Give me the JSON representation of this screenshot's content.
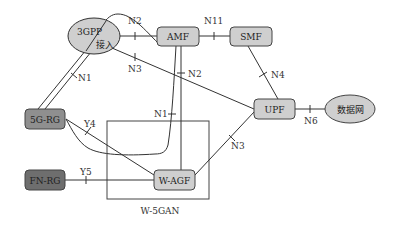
{
  "diagram": {
    "nodes": {
      "access_3gpp": {
        "label_top": "3GPP",
        "label_bottom": "接入",
        "shape": "ellipse",
        "fill": "#cfcfcf"
      },
      "amf": {
        "label": "AMF",
        "shape": "rounded-rect",
        "fill": "#cfcfcf"
      },
      "smf": {
        "label": "SMF",
        "shape": "rounded-rect",
        "fill": "#cfcfcf"
      },
      "upf": {
        "label": "UPF",
        "shape": "rounded-rect",
        "fill": "#cfcfcf"
      },
      "data_network": {
        "label": "数据网",
        "shape": "ellipse",
        "fill": "#cfcfcf"
      },
      "rg_5g": {
        "label": "5G-RG",
        "shape": "rounded-rect",
        "fill": "#8f8f8f"
      },
      "fn_rg": {
        "label": "FN-RG",
        "shape": "rounded-rect",
        "fill": "#6e6e6e"
      },
      "w_agf": {
        "label": "W-AGF",
        "shape": "rounded-rect",
        "fill": "#cfcfcf"
      }
    },
    "group": {
      "label": "W-5GAN"
    },
    "interfaces": {
      "n2_top": "N2",
      "n11": "N11",
      "n3_top": "N3",
      "n1_left": "N1",
      "n2_mid": "N2",
      "n4": "N4",
      "n6": "N6",
      "n1_mid": "N1",
      "y4": "Y4",
      "y5": "Y5",
      "n3_bottom": "N3"
    },
    "edges": [
      {
        "from": "3GPP接入",
        "to": "AMF",
        "interface": "N2"
      },
      {
        "from": "3GPP接入",
        "to": "UPF",
        "interface": "N3"
      },
      {
        "from": "3GPP接入",
        "to": "5G-RG",
        "interface": "N1"
      },
      {
        "from": "AMF",
        "to": "SMF",
        "interface": "N11"
      },
      {
        "from": "AMF",
        "to": "W-AGF",
        "interface": "N2"
      },
      {
        "from": "AMF",
        "to": "5G-RG",
        "interface": "N1"
      },
      {
        "from": "SMF",
        "to": "UPF",
        "interface": "N4"
      },
      {
        "from": "UPF",
        "to": "数据网",
        "interface": "N6"
      },
      {
        "from": "5G-RG",
        "to": "W-AGF",
        "interface": "Y4"
      },
      {
        "from": "FN-RG",
        "to": "W-AGF",
        "interface": "Y5"
      },
      {
        "from": "W-AGF",
        "to": "UPF",
        "interface": "N3"
      }
    ]
  }
}
